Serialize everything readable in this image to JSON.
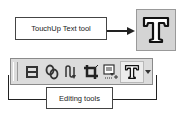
{
  "callouts": {
    "touchup_label": "TouchUp Text tool",
    "editing_label": "Editing tools"
  },
  "toolbar": {
    "items": [
      {
        "name": "article-tool",
        "icon": "article-icon"
      },
      {
        "name": "link-tool",
        "icon": "link-icon"
      },
      {
        "name": "touchup-reading-order-tool",
        "icon": "reading-order-icon"
      },
      {
        "name": "crop-tool",
        "icon": "crop-icon"
      },
      {
        "name": "touchup-object-tool",
        "icon": "touchup-object-icon"
      },
      {
        "name": "touchup-text-tool",
        "icon": "touchup-text-icon",
        "active": true
      }
    ],
    "dropdown": "chevron-down-icon"
  },
  "colors": {
    "toolbar_bg": "#dcdcdc",
    "big_icon_bg": "#d4d4d4",
    "line": "#222222"
  }
}
